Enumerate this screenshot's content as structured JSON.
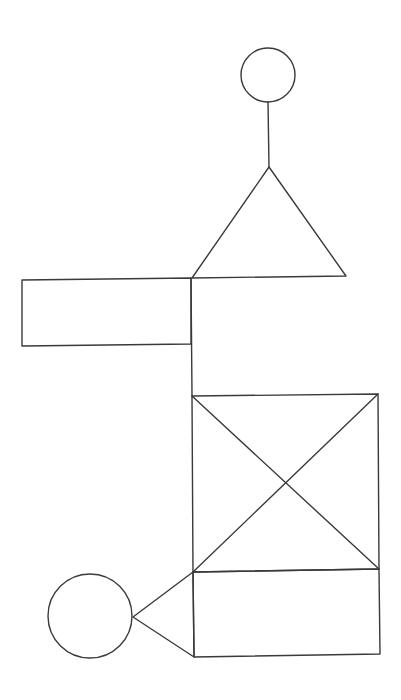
{
  "diagram": {
    "width": 401,
    "height": 700,
    "background": "#ffffff",
    "stroke_color": "#3a3a3a",
    "stroke_width": 1.4,
    "shapes": [
      {
        "name": "top-circle",
        "type": "circle",
        "cx": 268,
        "cy": 75,
        "r": 27
      },
      {
        "name": "head-stem-line",
        "type": "line",
        "x1": 268,
        "y1": 102,
        "x2": 269,
        "y2": 167
      },
      {
        "name": "upper-triangle",
        "type": "polygon",
        "points": "269,167 192,278 346,276"
      },
      {
        "name": "left-rectangle",
        "type": "polygon",
        "points": "22,280 191,278 191,344 22,346"
      },
      {
        "name": "vertical-connector-line",
        "type": "line",
        "x1": 191,
        "y1": 278,
        "x2": 192,
        "y2": 396
      },
      {
        "name": "x-box",
        "type": "polygon",
        "points": "192,396 378,394 379,569 193,572"
      },
      {
        "name": "x-box-diagonal-1",
        "type": "line",
        "x1": 192,
        "y1": 396,
        "x2": 379,
        "y2": 569
      },
      {
        "name": "x-box-diagonal-2",
        "type": "line",
        "x1": 378,
        "y1": 394,
        "x2": 193,
        "y2": 572
      },
      {
        "name": "lower-box",
        "type": "polygon",
        "points": "193,572 379,569 380,654 194,657"
      },
      {
        "name": "side-triangle",
        "type": "polygon",
        "points": "133,617 193,572 194,657"
      },
      {
        "name": "bottom-left-circle",
        "type": "circle",
        "cx": 90,
        "cy": 616,
        "r": 42
      }
    ]
  }
}
